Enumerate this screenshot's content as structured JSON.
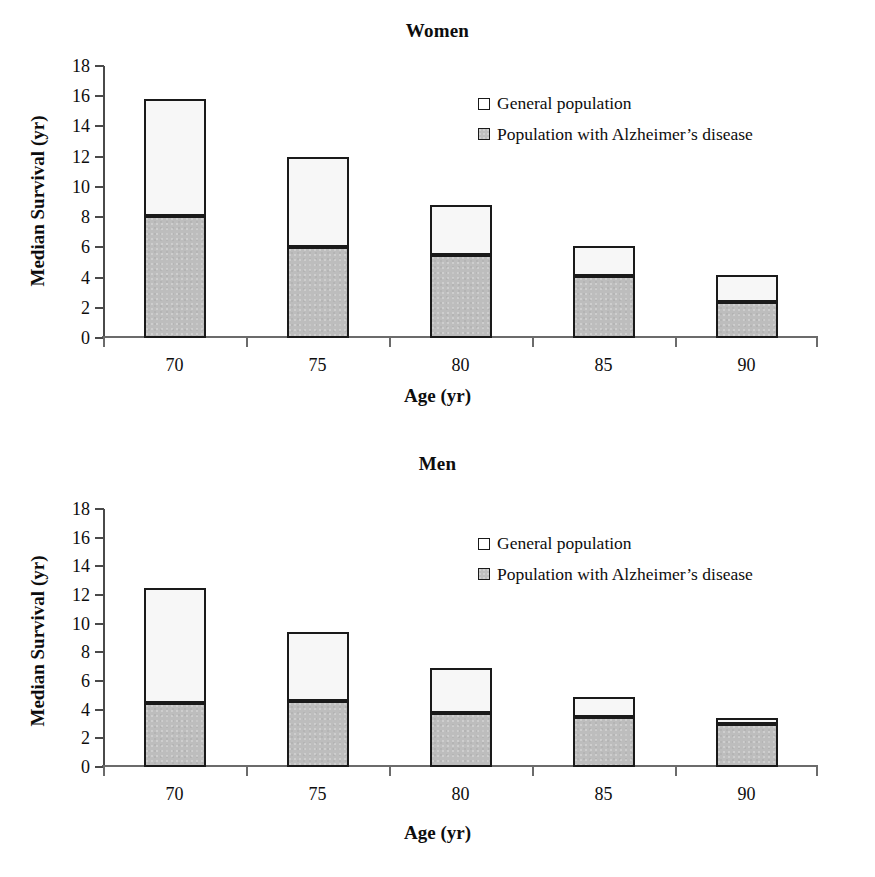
{
  "figure": {
    "panels": [
      "women",
      "men"
    ]
  },
  "chart_data": [
    {
      "type": "bar",
      "title": "Women",
      "xlabel": "Age (yr)",
      "ylabel": "Median Survival (yr)",
      "categories": [
        "70",
        "75",
        "80",
        "85",
        "90"
      ],
      "ylim": [
        0,
        18
      ],
      "yticks": [
        0,
        2,
        4,
        6,
        8,
        10,
        12,
        14,
        16,
        18
      ],
      "grid": false,
      "stacked": true,
      "legend_position": "upper right inside",
      "series": [
        {
          "name": "Population with Alzheimer's disease",
          "color": "#bdbdbd",
          "values": [
            8.1,
            6.0,
            5.5,
            4.1,
            2.4
          ]
        },
        {
          "name": "General population",
          "color": "#f7f7f7",
          "values": [
            7.7,
            6.0,
            3.3,
            2.0,
            1.8
          ]
        }
      ],
      "totals": [
        15.8,
        12.0,
        8.8,
        6.1,
        4.2
      ]
    },
    {
      "type": "bar",
      "title": "Men",
      "xlabel": "Age (yr)",
      "ylabel": "Median Survival (yr)",
      "categories": [
        "70",
        "75",
        "80",
        "85",
        "90"
      ],
      "ylim": [
        0,
        18
      ],
      "yticks": [
        0,
        2,
        4,
        6,
        8,
        10,
        12,
        14,
        16,
        18
      ],
      "grid": false,
      "stacked": true,
      "legend_position": "upper right inside",
      "series": [
        {
          "name": "Population with Alzheimer's disease",
          "color": "#bdbdbd",
          "values": [
            4.5,
            4.6,
            3.75,
            3.5,
            3.0
          ]
        },
        {
          "name": "General population",
          "color": "#f7f7f7",
          "values": [
            8.0,
            4.8,
            3.15,
            1.4,
            0.4
          ]
        }
      ],
      "totals": [
        12.5,
        9.4,
        6.9,
        4.9,
        3.4
      ]
    }
  ],
  "legend": {
    "general_label": "General population",
    "ad_label": "Population with Alzheimer’s disease"
  },
  "colors": {
    "general_fill": "#f7f7f7",
    "ad_fill": "#bdbdbd",
    "outline": "#1a1a1a",
    "axis": "#4a4a4a"
  }
}
